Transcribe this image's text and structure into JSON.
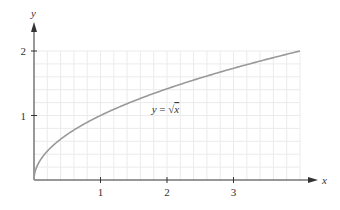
{
  "chart_data": {
    "type": "line",
    "title": "",
    "xlabel": "x",
    "ylabel": "y",
    "xlim": [
      0,
      4
    ],
    "ylim": [
      0,
      2
    ],
    "grid": true,
    "grid_step": 0.2,
    "xticks": [
      1,
      2,
      3
    ],
    "yticks": [
      1,
      2
    ],
    "xtick_labels": [
      "1",
      "2",
      "3"
    ],
    "ytick_labels": [
      "1",
      "2"
    ],
    "series": [
      {
        "name": "y = √x",
        "function": "sqrt(x)",
        "x": [
          0,
          0.25,
          0.5,
          1,
          1.5,
          2,
          2.5,
          3,
          3.5,
          4
        ],
        "values": [
          0,
          0.5,
          0.707,
          1,
          1.225,
          1.414,
          1.581,
          1.732,
          1.871,
          2
        ],
        "color": "#999999"
      }
    ],
    "annotations": [
      {
        "text_prefix": "y = ",
        "text_radical": "√",
        "text_var": "x",
        "x": 1.8,
        "y": 1.1
      }
    ]
  },
  "colors": {
    "axis": "#333333",
    "grid": "#ebebeb",
    "curve": "#999999",
    "text": "#333333"
  }
}
